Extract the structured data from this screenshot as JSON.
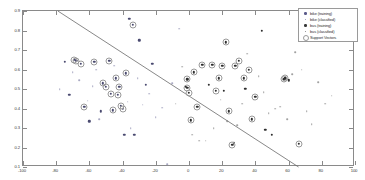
{
  "chart_data": {
    "type": "scatter",
    "title": "",
    "xlabel": "",
    "ylabel": "",
    "xlim": [
      -100,
      100
    ],
    "ylim": [
      0.1,
      0.9
    ],
    "grid": false,
    "legend_position": "top-right",
    "xticks": [
      -100,
      -80,
      -60,
      -40,
      -20,
      0,
      20,
      40,
      60,
      80,
      100
    ],
    "xticklabels": [
      "-100",
      "-80",
      "-60",
      "-40",
      "-20",
      "0",
      "20",
      "40",
      "60",
      "80",
      "100"
    ],
    "yticks": [
      0.1,
      0.2,
      0.3,
      0.4,
      0.5,
      0.6,
      0.7,
      0.8,
      0.9
    ],
    "yticklabels": [
      "0.1",
      "0.2",
      "0.3",
      "0.4",
      "0.5",
      "0.6",
      "0.7",
      "0.8",
      "0.9"
    ],
    "legend": [
      {
        "label": "bike (training)",
        "marker": "dot-large",
        "color": "#5b5b8a"
      },
      {
        "label": "bike (classified)",
        "marker": "dot-small",
        "color": "#8a8ab0"
      },
      {
        "label": "bus (training)",
        "marker": "dot-large",
        "color": "#3a3a3a"
      },
      {
        "label": "bus (classified)",
        "marker": "dot-small",
        "color": "#7a7a7a"
      },
      {
        "label": "Support Vectors",
        "marker": "ring",
        "color": "#9a9a9a"
      }
    ],
    "annotations": [
      {
        "type": "line",
        "name": "decision-boundary",
        "x": [
          -79,
          66
        ],
        "y": [
          0.9,
          0.1
        ],
        "color": "#6a6a6a"
      }
    ],
    "series": [
      {
        "name": "bike (training)",
        "marker": "dot-large",
        "color": "#4a4a70",
        "points": [
          [
            -75,
            0.64
          ],
          [
            -72,
            0.47
          ],
          [
            -69,
            0.65
          ],
          [
            -68,
            0.645
          ],
          [
            -65,
            0.63
          ],
          [
            -63,
            0.41
          ],
          [
            -60,
            0.335
          ],
          [
            -57,
            0.64
          ],
          [
            -53,
            0.385
          ],
          [
            -52,
            0.53
          ],
          [
            -50,
            0.51
          ],
          [
            -48,
            0.645
          ],
          [
            -47,
            0.475
          ],
          [
            -46,
            0.39
          ],
          [
            -44,
            0.555
          ],
          [
            -43,
            0.47
          ],
          [
            -42,
            0.51
          ],
          [
            -41,
            0.415
          ],
          [
            -40,
            0.4
          ],
          [
            -39,
            0.265
          ],
          [
            -38,
            0.58
          ],
          [
            -36,
            0.86
          ],
          [
            -34,
            0.83
          ],
          [
            -33,
            0.265
          ],
          [
            -30,
            0.75
          ],
          [
            -26,
            0.52
          ],
          [
            -22,
            0.63
          ]
        ]
      },
      {
        "name": "bike (classified)",
        "marker": "dot-small",
        "color": "#8888ac",
        "points": [
          [
            -78,
            0.5
          ],
          [
            -70,
            0.585
          ],
          [
            -66,
            0.545
          ],
          [
            -61,
            0.44
          ],
          [
            -58,
            0.515
          ],
          [
            -56,
            0.6
          ],
          [
            -54,
            0.345
          ],
          [
            -45,
            0.62
          ],
          [
            -37,
            0.435
          ],
          [
            -35,
            0.3
          ],
          [
            -31,
            0.555
          ],
          [
            -28,
            0.42
          ],
          [
            -24,
            0.475
          ],
          [
            -20,
            0.355
          ],
          [
            -16,
            0.405
          ],
          [
            -13,
            0.115
          ],
          [
            -10,
            0.53
          ],
          [
            -6,
            0.81
          ]
        ]
      },
      {
        "name": "bus (training)",
        "marker": "dot-large",
        "color": "#2e2e2e",
        "points": [
          [
            -2,
            0.51
          ],
          [
            -1,
            0.505
          ],
          [
            -1,
            0.55
          ],
          [
            0,
            0.48
          ],
          [
            1,
            0.34
          ],
          [
            3,
            0.585
          ],
          [
            5,
            0.41
          ],
          [
            8,
            0.625
          ],
          [
            12,
            0.52
          ],
          [
            14,
            0.625
          ],
          [
            16,
            0.49
          ],
          [
            18,
            0.555
          ],
          [
            20,
            0.62
          ],
          [
            21,
            0.49
          ],
          [
            22,
            0.74
          ],
          [
            24,
            0.385
          ],
          [
            26,
            0.215
          ],
          [
            27,
            0.225
          ],
          [
            28,
            0.62
          ],
          [
            30,
            0.645
          ],
          [
            33,
            0.555
          ],
          [
            34,
            0.5
          ],
          [
            36,
            0.6
          ],
          [
            38,
            0.345
          ],
          [
            40,
            0.46
          ],
          [
            44,
            0.8
          ],
          [
            46,
            0.29
          ],
          [
            50,
            0.265
          ],
          [
            57,
            0.55
          ],
          [
            58,
            0.555
          ],
          [
            60,
            0.545
          ],
          [
            66,
            0.22
          ]
        ]
      },
      {
        "name": "bus (classified)",
        "marker": "dot-small",
        "color": "#7d7d7d",
        "points": [
          [
            -8,
            0.425
          ],
          [
            -4,
            0.615
          ],
          [
            2,
            0.265
          ],
          [
            6,
            0.235
          ],
          [
            10,
            0.235
          ],
          [
            15,
            0.3
          ],
          [
            19,
            0.445
          ],
          [
            23,
            0.335
          ],
          [
            29,
            0.315
          ],
          [
            32,
            0.425
          ],
          [
            35,
            0.68
          ],
          [
            39,
            0.445
          ],
          [
            42,
            0.565
          ],
          [
            45,
            0.485
          ],
          [
            48,
            0.375
          ],
          [
            52,
            0.4
          ],
          [
            55,
            0.41
          ],
          [
            59,
            0.345
          ],
          [
            62,
            0.575
          ],
          [
            64,
            0.69
          ],
          [
            68,
            0.6
          ],
          [
            71,
            0.385
          ],
          [
            74,
            0.32
          ],
          [
            78,
            0.535
          ],
          [
            82,
            0.425
          ],
          [
            86,
            0.465
          ]
        ]
      },
      {
        "name": "Support Vectors",
        "marker": "ring",
        "color": "#9a9a9a",
        "points": [
          [
            -69,
            0.65
          ],
          [
            -68,
            0.645
          ],
          [
            -65,
            0.63
          ],
          [
            -63,
            0.41
          ],
          [
            -57,
            0.64
          ],
          [
            -52,
            0.53
          ],
          [
            -50,
            0.51
          ],
          [
            -48,
            0.645
          ],
          [
            -47,
            0.475
          ],
          [
            -46,
            0.39
          ],
          [
            -44,
            0.555
          ],
          [
            -43,
            0.47
          ],
          [
            -42,
            0.51
          ],
          [
            -41,
            0.415
          ],
          [
            -40,
            0.4
          ],
          [
            -38,
            0.58
          ],
          [
            -34,
            0.83
          ],
          [
            -1,
            0.505
          ],
          [
            -1,
            0.55
          ],
          [
            0,
            0.48
          ],
          [
            1,
            0.34
          ],
          [
            3,
            0.585
          ],
          [
            5,
            0.41
          ],
          [
            8,
            0.625
          ],
          [
            14,
            0.625
          ],
          [
            16,
            0.49
          ],
          [
            18,
            0.555
          ],
          [
            20,
            0.62
          ],
          [
            22,
            0.74
          ],
          [
            24,
            0.385
          ],
          [
            26,
            0.215
          ],
          [
            28,
            0.62
          ],
          [
            30,
            0.645
          ],
          [
            33,
            0.555
          ],
          [
            36,
            0.6
          ],
          [
            38,
            0.345
          ],
          [
            40,
            0.46
          ],
          [
            57,
            0.55
          ],
          [
            58,
            0.555
          ],
          [
            66,
            0.22
          ]
        ]
      }
    ]
  }
}
